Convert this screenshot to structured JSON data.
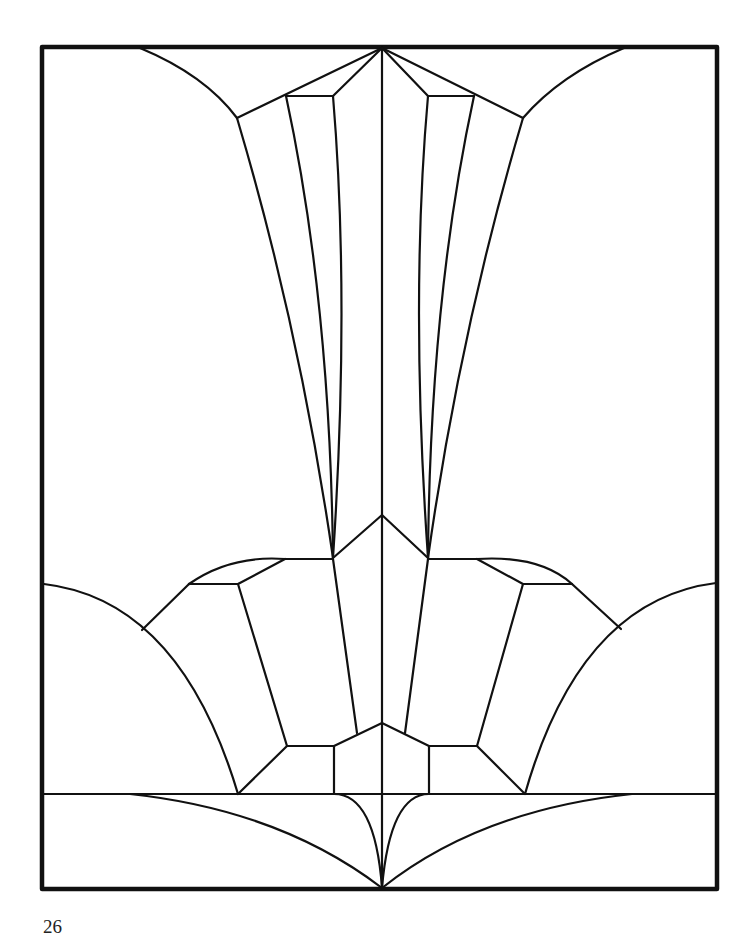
{
  "page": {
    "number": "26",
    "background": "#ffffff",
    "line_color": "#111111"
  },
  "pattern": {
    "type": "stained-glass line art",
    "frame": {
      "x": 42,
      "y": 46,
      "width": 676,
      "height": 844
    }
  }
}
